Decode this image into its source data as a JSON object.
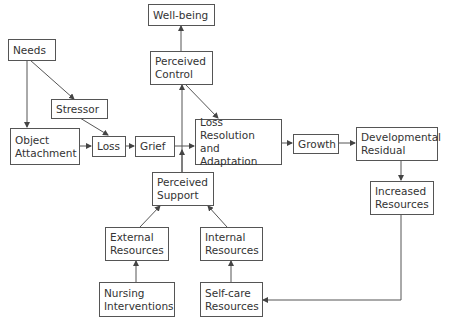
{
  "diagram": {
    "type": "flowchart",
    "nodes": {
      "needs": "Needs",
      "stressor": "Stressor",
      "object_attachment": "Object\nAttachment",
      "loss": "Loss",
      "grief": "Grief",
      "well_being": "Well-being",
      "perceived_control": "Perceived\nControl",
      "loss_resolution": "Loss\nResolution and\nAdaptation",
      "growth": "Growth",
      "developmental_residual": "Developmental\nResidual",
      "increased_resources": "Increased\nResources",
      "perceived_support": "Perceived\nSupport",
      "external_resources": "External\nResources",
      "internal_resources": "Internal\nResources",
      "nursing_interventions": "Nursing\nInterventions",
      "self_care_resources": "Self-care\nResources"
    },
    "edges": [
      {
        "from": "Needs",
        "to": "Object Attachment"
      },
      {
        "from": "Needs",
        "to": "Stressor"
      },
      {
        "from": "Stressor",
        "to": "Loss"
      },
      {
        "from": "Object Attachment",
        "to": "Loss"
      },
      {
        "from": "Loss",
        "to": "Grief"
      },
      {
        "from": "Grief",
        "to": "Loss Resolution and Adaptation"
      },
      {
        "from": "Perceived Support",
        "to": "Perceived Control"
      },
      {
        "from": "Perceived Control",
        "to": "Well-being"
      },
      {
        "from": "Perceived Control",
        "to": "Loss Resolution and Adaptation"
      },
      {
        "from": "Loss Resolution and Adaptation",
        "to": "Growth"
      },
      {
        "from": "Growth",
        "to": "Developmental Residual"
      },
      {
        "from": "Developmental Residual",
        "to": "Increased Resources"
      },
      {
        "from": "Increased Resources",
        "to": "Self-care Resources"
      },
      {
        "from": "Self-care Resources",
        "to": "Internal Resources"
      },
      {
        "from": "Nursing Interventions",
        "to": "External Resources"
      },
      {
        "from": "External Resources",
        "to": "Perceived Support"
      },
      {
        "from": "Internal Resources",
        "to": "Perceived Support"
      }
    ]
  },
  "colors": {
    "line": "#555555",
    "text": "#333333",
    "background": "#ffffff"
  }
}
